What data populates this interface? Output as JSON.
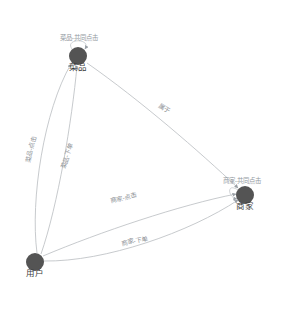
{
  "diagram": {
    "type": "directed-graph",
    "title": "",
    "background_color": "#ffffff",
    "node_color": "#545454",
    "edge_color": "#b9bcc0",
    "label_color": "#8d9196",
    "node_label_color": "#3c3c3c",
    "nodes": [
      {
        "id": "dish",
        "label": "菜品",
        "x": 78,
        "y": 56,
        "r": 9
      },
      {
        "id": "user",
        "label": "用户",
        "x": 35,
        "y": 262,
        "r": 9
      },
      {
        "id": "merchant",
        "label": "商家",
        "x": 245,
        "y": 195,
        "r": 9
      }
    ],
    "edges": [
      {
        "id": "dish-click",
        "label": "菜品-点击",
        "from": "user",
        "to": "dish",
        "label_x": 33,
        "label_y": 150,
        "label_rotate": -76
      },
      {
        "id": "dish-order",
        "label": "菜品-下单",
        "from": "user",
        "to": "dish",
        "label_x": 69,
        "label_y": 157,
        "label_rotate": -70
      },
      {
        "id": "belongs-to",
        "label": "属于",
        "from": "dish",
        "to": "merchant",
        "label_x": 163,
        "label_y": 110,
        "label_rotate": 32
      },
      {
        "id": "merchant-click",
        "label": "商家-点击",
        "from": "user",
        "to": "merchant",
        "label_x": 124,
        "label_y": 200,
        "label_rotate": -14
      },
      {
        "id": "merchant-order",
        "label": "商家-下单",
        "from": "user",
        "to": "merchant",
        "label_x": 135,
        "label_y": 243,
        "label_rotate": -11
      }
    ],
    "self_loops": [
      {
        "id": "dish-co-click",
        "label": "菜品-共同点击",
        "node": "dish",
        "label_x": 79,
        "label_y": 40
      },
      {
        "id": "merchant-co-click",
        "label": "商家-共同点击",
        "node": "merchant",
        "label_x": 242,
        "label_y": 183
      }
    ]
  }
}
